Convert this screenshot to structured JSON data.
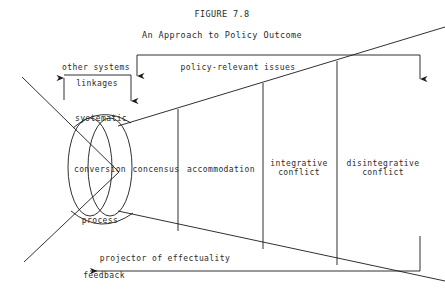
{
  "figure": {
    "number": "FIGURE 7.8",
    "title": "An Approach to Policy Outcome"
  },
  "inputs": {
    "other_systems": "other systems",
    "linkages": "linkages",
    "policy_relevant_issues": "policy-relevant issues"
  },
  "conversion_core": {
    "top": "systematic",
    "middle": "conversion",
    "bottom": "process"
  },
  "outcome_bands": [
    {
      "line1": "concensus",
      "line2": ""
    },
    {
      "line1": "accommodation",
      "line2": ""
    },
    {
      "line1": "integrative",
      "line2": "conflict"
    },
    {
      "line1": "disintegrative",
      "line2": "conflict"
    }
  ],
  "outputs": {
    "projector": "projector of effectuality",
    "feedback": "feedback"
  },
  "colors": {
    "stroke": "#1a1a1a",
    "text": "#2b2b2b",
    "background": "#ffffff"
  }
}
